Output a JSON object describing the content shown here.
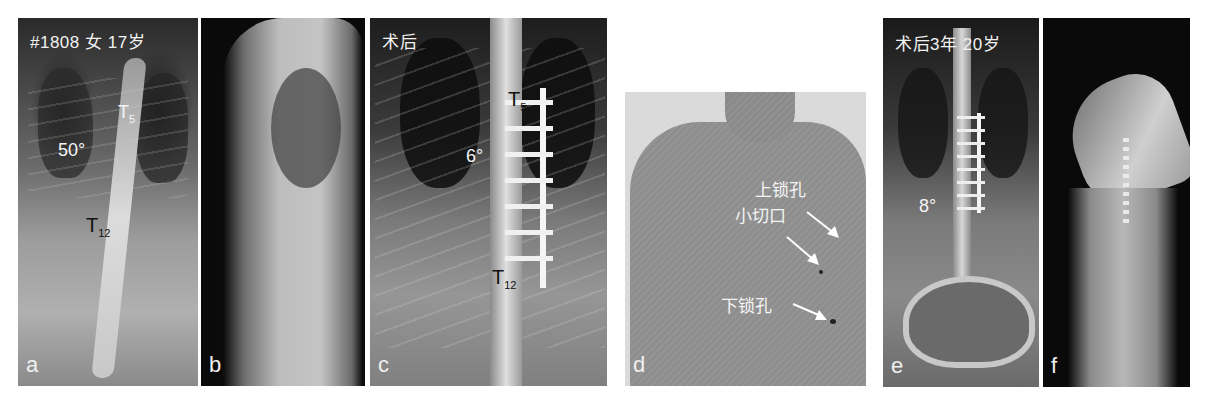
{
  "figure": {
    "panels": [
      {
        "id": "a",
        "letter": "a",
        "header": "#1808  女  17岁",
        "annotations": {
          "t5": "T",
          "t5_sub": "5",
          "angle": "50°",
          "t12": "T",
          "t12_sub": "12"
        }
      },
      {
        "id": "b",
        "letter": "b"
      },
      {
        "id": "c",
        "letter": "c",
        "header": "术后",
        "annotations": {
          "t5": "T",
          "t5_sub": "5",
          "angle": "6°",
          "t12": "T",
          "t12_sub": "12"
        }
      },
      {
        "id": "d",
        "letter": "d",
        "annotations": {
          "upper_port": "上锁孔",
          "small_incision": "小切口",
          "lower_port": "下锁孔"
        }
      },
      {
        "id": "e",
        "letter": "e",
        "header": "术后3年  20岁",
        "annotations": {
          "angle": "8°"
        }
      },
      {
        "id": "f",
        "letter": "f"
      }
    ]
  }
}
